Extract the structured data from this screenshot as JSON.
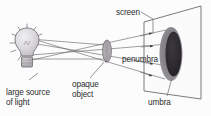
{
  "diagram": {
    "type": "optics-shadow-diagram",
    "background_color": "#fdfcfd",
    "line_color": "#5a5a5a",
    "text_color": "#2b2b2b",
    "labels": {
      "screen": "screen",
      "penumbra": "penumbra",
      "umbra": "umbra",
      "opaque_object": "opaque\nobject",
      "light_source": "large source\nof light"
    },
    "elements": {
      "bulb_name": "light-bulb",
      "bulb_glass_color": "#d6d4d6",
      "bulb_base_color": "#b8b5b8",
      "opaque_object_color": "#a9a6aa",
      "screen_fill": "#fcfbfc",
      "penumbra_color": "#8e8b90",
      "umbra_color": "#2d2b2e",
      "ray_count": 6,
      "arrowhead_style": "solid-triangle"
    }
  }
}
